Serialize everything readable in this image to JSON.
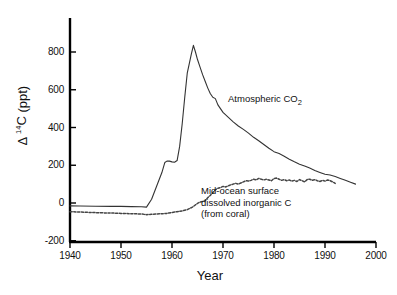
{
  "chart_data": {
    "type": "line",
    "title": "",
    "xlabel": "Year",
    "ylabel_parts": {
      "delta": "Δ",
      "superscript": "14",
      "element": "C",
      "units": "(ppt)"
    },
    "ylabel": "Δ 14C (ppt)",
    "xlim": [
      1940,
      2000
    ],
    "ylim": [
      -200,
      900
    ],
    "grid": false,
    "legend_position": "inline-annotations",
    "xticks": [
      "1940",
      "1950",
      "1960",
      "1970",
      "1980",
      "1990",
      "2000"
    ],
    "xtick_values": [
      1940,
      1950,
      1960,
      1970,
      1980,
      1990,
      2000
    ],
    "yticks": [
      "-200",
      "0",
      "200",
      "400",
      "600",
      "800"
    ],
    "ytick_values": [
      -200,
      0,
      200,
      400,
      600,
      800
    ],
    "series": [
      {
        "name": "Atmospheric CO2",
        "annotation": "Atmospheric CO",
        "annotation_subscript": "2",
        "style": "solid",
        "color": "#333333",
        "x": [
          1940,
          1942,
          1945,
          1948,
          1950,
          1952,
          1954,
          1955,
          1956,
          1957,
          1958,
          1958.6,
          1959,
          1959.5,
          1960,
          1960.5,
          1961,
          1961.5,
          1962,
          1962.5,
          1963,
          1963.4,
          1963.8,
          1964.2,
          1964.6,
          1965,
          1965.5,
          1966,
          1966.5,
          1967,
          1967.5,
          1968,
          1968.5,
          1969,
          1970,
          1971,
          1972,
          1973,
          1974,
          1975,
          1976,
          1977,
          1978,
          1979,
          1980,
          1981,
          1982,
          1983,
          1984,
          1985,
          1986,
          1987,
          1988,
          1989,
          1990,
          1991,
          1992,
          1993,
          1994,
          1995,
          1996
        ],
        "y": [
          -15,
          -16,
          -17,
          -18,
          -18,
          -19,
          -20,
          -22,
          20,
          90,
          160,
          215,
          222,
          222,
          218,
          216,
          225,
          300,
          420,
          560,
          690,
          740,
          790,
          835,
          800,
          760,
          720,
          680,
          645,
          610,
          580,
          560,
          553,
          520,
          480,
          455,
          430,
          408,
          390,
          370,
          348,
          330,
          310,
          290,
          272,
          262,
          248,
          232,
          218,
          205,
          196,
          185,
          172,
          162,
          152,
          148,
          140,
          130,
          120,
          110,
          100
        ]
      },
      {
        "name": "Mid-ocean surface dissolved inorganic C (from coral)",
        "annotation_lines": [
          "Mid-ocean surface",
          "dissolved inorganic C",
          "(from coral)"
        ],
        "style": "dashed",
        "color": "#444444",
        "x": [
          1940,
          1942,
          1944,
          1946,
          1948,
          1950,
          1952,
          1954,
          1955,
          1956,
          1957,
          1958,
          1959,
          1960,
          1961,
          1962,
          1963,
          1964,
          1964.5,
          1965,
          1965.5,
          1966,
          1966.5,
          1967,
          1967.5,
          1968,
          1968.5,
          1969,
          1969.5,
          1970,
          1970.5,
          1971,
          1971.5,
          1972,
          1972.5,
          1973,
          1973.5,
          1974,
          1974.5,
          1975,
          1975.5,
          1976,
          1976.5,
          1977,
          1977.5,
          1978,
          1978.5,
          1979,
          1979.5,
          1980,
          1980.5,
          1981,
          1981.5,
          1982,
          1982.5,
          1983,
          1983.5,
          1984,
          1984.5,
          1985,
          1985.5,
          1986,
          1986.5,
          1987,
          1987.5,
          1988,
          1988.5,
          1989,
          1989.5,
          1990,
          1990.5,
          1991,
          1991.5,
          1992
        ],
        "y": [
          -46,
          -48,
          -50,
          -52,
          -53,
          -55,
          -57,
          -58,
          -62,
          -60,
          -58,
          -57,
          -55,
          -50,
          -46,
          -42,
          -35,
          -22,
          -12,
          -2,
          5,
          8,
          12,
          28,
          40,
          55,
          70,
          78,
          82,
          88,
          85,
          90,
          96,
          100,
          104,
          100,
          106,
          112,
          118,
          116,
          120,
          126,
          122,
          130,
          126,
          122,
          126,
          122,
          118,
          130,
          132,
          126,
          120,
          124,
          118,
          122,
          116,
          120,
          114,
          124,
          118,
          112,
          124,
          126,
          120,
          124,
          118,
          114,
          120,
          116,
          122,
          118,
          112,
          104
        ]
      }
    ]
  },
  "axes": {
    "y_title_display": "Δ 14C (ppt)",
    "x_title_display": "Year"
  }
}
